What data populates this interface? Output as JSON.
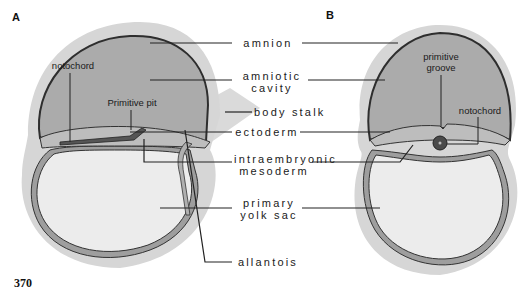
{
  "figure": {
    "page_number": "370",
    "panels": [
      {
        "id": "A"
      },
      {
        "id": "B"
      }
    ],
    "center_labels": {
      "amnion": "amnion",
      "amniotic_cavity": "amniotic\ncavity",
      "body_stalk": "body stalk",
      "ectoderm": "ectoderm",
      "intraembryonic_mesoderm": "intraembryonic\nmesoderm",
      "primary_yolk_sac": "primary\nyolk sac",
      "allantois": "allantois"
    },
    "panel_a_labels": {
      "notochord": "notochord",
      "primitive_pit": "Primitive pit"
    },
    "panel_b_labels": {
      "primitive_groove": "primitive\ngroove",
      "notochord": "notochord"
    },
    "colors": {
      "outer_halo": "#d4d4d4",
      "amniotic_cavity_fill": "#a9a9a9",
      "yolk_sac_fill": "#ececec",
      "membrane_band": "#9a9a9a",
      "outline": "#333333"
    }
  }
}
